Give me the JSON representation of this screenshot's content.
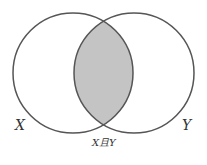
{
  "diagram": {
    "type": "venn",
    "sets": [
      {
        "id": "X",
        "label": "X"
      },
      {
        "id": "Y",
        "label": "Y"
      }
    ],
    "intersection": {
      "label": "X且Y",
      "shaded": true
    },
    "colors": {
      "stroke": "#555555",
      "intersection_fill": "#c4c4c4",
      "background": "#ffffff"
    }
  }
}
